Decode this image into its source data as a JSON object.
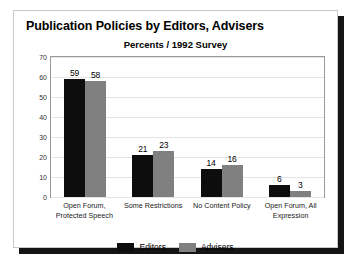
{
  "chart_data": {
    "type": "bar",
    "title": "Publication Policies by Editors, Advisers",
    "subtitle": "Percents / 1992 Survey",
    "xlabel": "",
    "ylabel": "",
    "ylim": [
      0,
      70
    ],
    "yticks": [
      0,
      10,
      20,
      30,
      40,
      50,
      60,
      70
    ],
    "grid": true,
    "legend_position": "bottom",
    "categories": [
      "Open Forum, Protected Speech",
      "Some Restrictions",
      "No Content Policy",
      "Open Forum, All Expression"
    ],
    "series": [
      {
        "name": "Editors",
        "color": "#0d0d0d",
        "values": [
          59,
          21,
          14,
          6
        ]
      },
      {
        "name": "Advisers",
        "color": "#808080",
        "values": [
          58,
          23,
          16,
          3
        ]
      }
    ]
  },
  "axis": {
    "tick_labels": [
      "70",
      "60",
      "50",
      "40",
      "30",
      "20",
      "10",
      "0"
    ]
  },
  "categories_display": [
    "Open Forum,\nProtected Speech",
    "Some Restrictions",
    "No Content Policy",
    "Open Forum, All\nExpression"
  ],
  "bar_labels": {
    "g0": {
      "editors": "59",
      "advisers": "58"
    },
    "g1": {
      "editors": "21",
      "advisers": "23"
    },
    "g2": {
      "editors": "14",
      "advisers": "16"
    },
    "g3": {
      "editors": "6",
      "advisers": "3"
    }
  },
  "legend": {
    "items": [
      {
        "label": "Editors",
        "color": "#0d0d0d"
      },
      {
        "label": "Advisers",
        "color": "#808080"
      }
    ]
  }
}
